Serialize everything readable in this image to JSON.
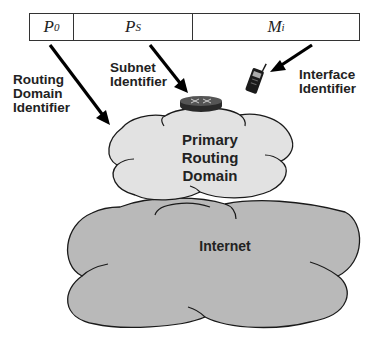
{
  "address": {
    "fields": [
      {
        "symbol": "P",
        "subscript": "0"
      },
      {
        "symbol": "P",
        "subscript": "S"
      },
      {
        "symbol": "M",
        "subscript": "i"
      }
    ]
  },
  "labels": {
    "routing_domain_identifier": "Routing\nDomain\nIdentifier",
    "subnet_identifier": "Subnet\nIdentifier",
    "interface_identifier": "Interface\nIdentifier"
  },
  "clouds": {
    "primary": "Primary\nRouting\nDomain",
    "internet": "Internet"
  },
  "icons": {
    "router": "router-icon",
    "device": "mobile-phone-icon"
  },
  "colors": {
    "primary_cloud_fill": "#e2e2e2",
    "internet_cloud_fill": "#b9b9b9",
    "outline": "#1a1a1a",
    "arrow": "#000000"
  }
}
